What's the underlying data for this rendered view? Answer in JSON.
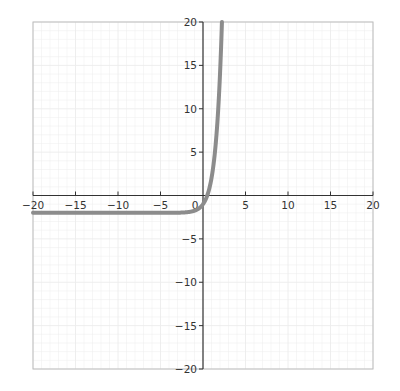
{
  "chart_data": {
    "type": "line",
    "title": "",
    "xlabel": "",
    "ylabel": "",
    "xlim": [
      -20,
      20
    ],
    "ylim": [
      -20,
      20
    ],
    "grid": true,
    "minor_grid_step": 1,
    "x_ticks": [
      -20,
      -15,
      -10,
      -5,
      5,
      10,
      15,
      20
    ],
    "y_ticks": [
      -20,
      -15,
      -10,
      -5,
      5,
      10,
      15,
      20
    ],
    "x_tick_labels": [
      "−20",
      "−15",
      "−10",
      "−5",
      "5",
      "10",
      "15",
      "20"
    ],
    "y_tick_labels": [
      "−20",
      "−15",
      "−10",
      "−5",
      "5",
      "10",
      "15",
      "20"
    ],
    "origin_label": "0",
    "series": [
      {
        "name": "curve",
        "description": "exponential curve with horizontal asymptote near y = -2, rising steeply through (0, -1) to y = 20 near x ≈ 2.2",
        "x": [
          -20,
          -15,
          -10,
          -5,
          -2,
          -1,
          -0.5,
          0,
          0.5,
          1,
          1.5,
          2,
          2.23
        ],
        "y": [
          -2,
          -2,
          -2,
          -2,
          -1.94,
          -1.75,
          -1.5,
          -1,
          0,
          2,
          6,
          14,
          20
        ],
        "color": "#8c8c8c"
      }
    ],
    "legend": null
  },
  "colors": {
    "curve": "#8c8c8c",
    "axis": "#333333",
    "frame": "#bdbdbd",
    "grid": "#ececec"
  }
}
